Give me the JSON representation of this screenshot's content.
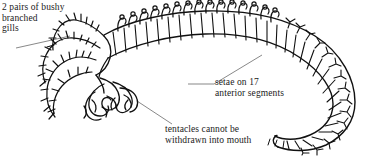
{
  "figure": {
    "ink_color": "#111111",
    "background_color": "#ffffff",
    "leader_line_color": "#555555"
  },
  "labels": [
    {
      "id": "gills",
      "name": "label-gills",
      "lines": [
        "2 pairs of bushy",
        "branched",
        "gills"
      ],
      "text": "2 pairs of bushy\nbranched\ngills"
    },
    {
      "id": "setae",
      "name": "label-setae",
      "lines": [
        "setae on 17",
        "anterior segments"
      ],
      "text": "setae on 17\nanterior segments"
    },
    {
      "id": "tentacles",
      "name": "label-tentacles",
      "lines": [
        "tentacles cannot be",
        "withdrawn into mouth"
      ],
      "text": "tentacles cannot be\nwithdrawn into mouth"
    }
  ]
}
